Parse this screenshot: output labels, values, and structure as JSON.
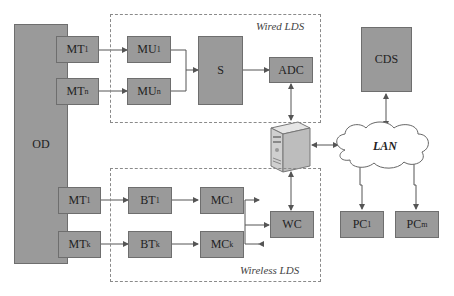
{
  "diagram": {
    "groups": {
      "wired": {
        "label": "Wired LDS"
      },
      "wireless": {
        "label": "Wireless LDS"
      }
    },
    "nodes": {
      "od": {
        "label": "OD"
      },
      "mt1_top": {
        "label": "MT",
        "sub": "1"
      },
      "mtn": {
        "label": "MT",
        "sub": "n"
      },
      "mu1": {
        "label": "MU",
        "sub": "1"
      },
      "mun": {
        "label": "MU",
        "sub": "n"
      },
      "s": {
        "label": "S"
      },
      "adc": {
        "label": "ADC"
      },
      "cds": {
        "label": "CDS"
      },
      "lan": {
        "label": "LAN"
      },
      "mt1_bot": {
        "label": "MT",
        "sub": "1"
      },
      "mtk": {
        "label": "MT",
        "sub": "k"
      },
      "bt1": {
        "label": "BT",
        "sub": "1"
      },
      "btk": {
        "label": "BT",
        "sub": "k"
      },
      "mc1": {
        "label": "MC",
        "sub": "1"
      },
      "mck": {
        "label": "MC",
        "sub": "k"
      },
      "wc": {
        "label": "WC"
      },
      "pc1": {
        "label": "PC",
        "sub": "1"
      },
      "pcm": {
        "label": "PC",
        "sub": "m"
      }
    },
    "colors": {
      "box_fill": "#9a9a9a",
      "box_border": "#6e6e6e",
      "line": "#555555"
    }
  }
}
